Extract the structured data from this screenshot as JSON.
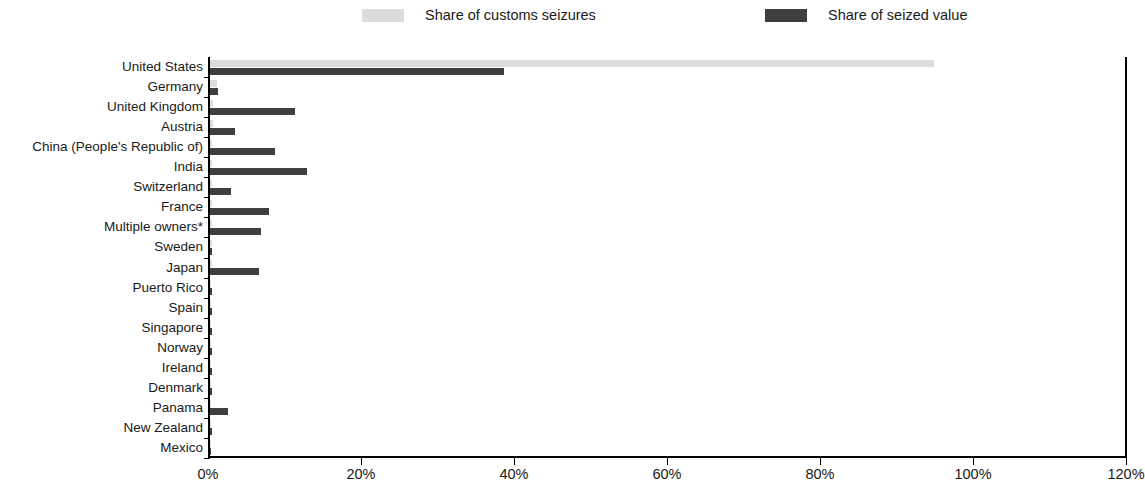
{
  "chart_data": {
    "type": "bar",
    "orientation": "horizontal",
    "title": "",
    "xlabel": "",
    "ylabel": "",
    "xlim": [
      0,
      120
    ],
    "xtick_labels": [
      "0%",
      "20%",
      "40%",
      "60%",
      "80%",
      "100%",
      "120%"
    ],
    "xtick_values": [
      0,
      20,
      40,
      60,
      80,
      100,
      120
    ],
    "grid": false,
    "legend_position": "top",
    "categories": [
      "United States",
      "Germany",
      "United Kingdom",
      "Austria",
      "China (People's Republic of)",
      "India",
      "Switzerland",
      "France",
      "Multiple owners*",
      "Sweden",
      "Japan",
      "Puerto Rico",
      "Spain",
      "Singapore",
      "Norway",
      "Ireland",
      "Denmark",
      "Panama",
      "New Zealand",
      "Mexico"
    ],
    "series": [
      {
        "name": "Share of customs seizures",
        "color": "#dcdcdc",
        "values": [
          94.7,
          0.9,
          0.4,
          0.4,
          0.3,
          0.3,
          0.3,
          0.2,
          0.2,
          0.2,
          0.2,
          0.1,
          0.1,
          0.1,
          0.1,
          0.1,
          0.1,
          0.1,
          0.1,
          0.1
        ]
      },
      {
        "name": "Share of seized value",
        "color": "#3f3f3f",
        "values": [
          38.4,
          1.0,
          11.1,
          3.3,
          8.5,
          12.7,
          2.7,
          7.7,
          6.7,
          0.2,
          6.4,
          0.2,
          0.2,
          0.2,
          0.2,
          0.2,
          0.2,
          2.4,
          0.2,
          0.1
        ]
      }
    ]
  },
  "legend": {
    "items": [
      {
        "label": "Share of customs seizures",
        "swatch": "light-gray-swatch"
      },
      {
        "label": "Share of seized value",
        "swatch": "dark-gray-swatch"
      }
    ]
  }
}
